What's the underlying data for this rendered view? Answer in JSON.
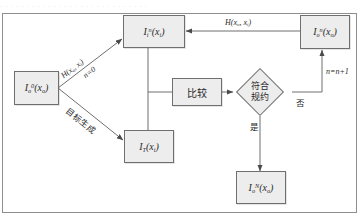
{
  "figure": {
    "top_cropped_line": "· · ·  · · · · · · · · · · · · · · · ·  · · · · · · · · ·",
    "frame_color": "#8e8e8e",
    "node_fill": "#ededed",
    "node_border": "#6f6f6f",
    "line_color": "#6f6f6f"
  },
  "nodes": {
    "source_initial": {
      "base": "I",
      "sub": "o",
      "sup": "0",
      "arg": "(x",
      "arg_sub": "o",
      "arg_end": ")"
    },
    "intermediate": {
      "base": "I",
      "sub": "i",
      "sup": "n",
      "arg": "(x",
      "arg_sub": "i",
      "arg_end": ")"
    },
    "output_n": {
      "base": "I",
      "sub": "o",
      "sup": "n",
      "arg": "(x",
      "arg_sub": "o",
      "arg_end": ")"
    },
    "target": {
      "base": "I",
      "sub": "T",
      "sup": "",
      "arg": "(x",
      "arg_sub": "i",
      "arg_end": ")"
    },
    "output_final": {
      "base": "I",
      "sub": "o",
      "sup": "N",
      "arg": "(x",
      "arg_sub": "o",
      "arg_end": ")"
    },
    "compare": {
      "label": "比较"
    },
    "decision": {
      "line1": "符合",
      "line2": "规约"
    }
  },
  "edge_labels": {
    "transfer_top": {
      "text": "H(x",
      "sub1": "o",
      "mid": ", x",
      "sub2": "i",
      "end": ")"
    },
    "transfer_diag": {
      "text": "H(x",
      "sub1": "o",
      "mid": ", x",
      "sub2": "i",
      "end": ")"
    },
    "iteration_init": "n=0",
    "target_generation": "目标生成",
    "branch_no": "否",
    "branch_yes": "是",
    "increment": "n=n+1"
  }
}
